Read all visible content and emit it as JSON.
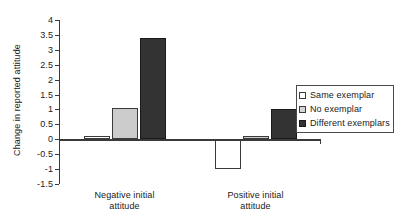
{
  "chart_data": {
    "type": "bar",
    "title": "",
    "xlabel": "",
    "ylabel": "Change in reported attitude",
    "categories": [
      "Negative initial\nattitude",
      "Positive initial\nattitude"
    ],
    "series": [
      {
        "name": "Same exemplar",
        "values": [
          0.1,
          -1.0
        ],
        "color": "#ffffff"
      },
      {
        "name": "No exemplar",
        "values": [
          1.05,
          0.1
        ],
        "color": "#cccccc"
      },
      {
        "name": "Different exemplars",
        "values": [
          3.4,
          1.0
        ],
        "color": "#333333"
      }
    ],
    "ylim": [
      -1.5,
      4
    ],
    "ytick_labels": [
      "4",
      "3.5",
      "3",
      "2.5",
      "2",
      "1.5",
      "1",
      "0.5",
      "0",
      "-0.5",
      "-1",
      "-1.5"
    ],
    "ytick_values": [
      4,
      3.5,
      3,
      2.5,
      2,
      1.5,
      1,
      0.5,
      0,
      -0.5,
      -1,
      -1.5
    ],
    "grid": false,
    "legend_position": "right",
    "axis_color": "#3a3a3a"
  }
}
